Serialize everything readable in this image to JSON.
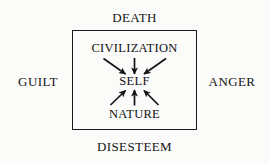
{
  "diagram": {
    "title_visible": false,
    "background_color": "#fbfbfa",
    "stroke_color": "#1b1b1b",
    "box": {
      "name": "self-box",
      "x": 72,
      "y": 30,
      "width": 125,
      "height": 100
    },
    "outer_labels": {
      "top": "DEATH",
      "bottom": "DISESTEEM",
      "left": "GUILT",
      "right": "ANGER"
    },
    "inner_labels": {
      "top": "CIVILIZATION",
      "center": "SELF",
      "bottom": "NATURE"
    },
    "arrows": [
      {
        "name": "civilization-to-self-left",
        "from": "CIVILIZATION",
        "to": "SELF",
        "direction": "down-right"
      },
      {
        "name": "civilization-to-self-center",
        "from": "CIVILIZATION",
        "to": "SELF",
        "direction": "down"
      },
      {
        "name": "civilization-to-self-right",
        "from": "CIVILIZATION",
        "to": "SELF",
        "direction": "down-left"
      },
      {
        "name": "nature-to-self-left",
        "from": "NATURE",
        "to": "SELF",
        "direction": "up-right"
      },
      {
        "name": "nature-to-self-center",
        "from": "NATURE",
        "to": "SELF",
        "direction": "up"
      },
      {
        "name": "nature-to-self-right",
        "from": "NATURE",
        "to": "SELF",
        "direction": "up-left"
      }
    ]
  }
}
